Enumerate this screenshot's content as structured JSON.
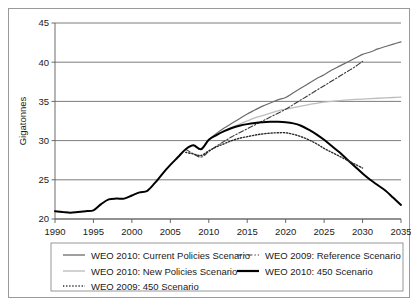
{
  "chart_data": {
    "type": "line",
    "title": "",
    "xlabel": "",
    "ylabel": "Gigatonnes",
    "xlim": [
      1990,
      2035
    ],
    "ylim": [
      20,
      45
    ],
    "ytick_step": 5,
    "xtick_step": 5,
    "grid": true,
    "grid_axis": "y",
    "legend_position": "bottom",
    "xticks": [
      "1990",
      "1995",
      "2000",
      "2005",
      "2010",
      "2015",
      "2020",
      "2025",
      "2030",
      "2035"
    ],
    "yticks": [
      "20",
      "25",
      "30",
      "35",
      "40",
      "45"
    ],
    "series": [
      {
        "name": "WEO 2010: Current Policies Scenario",
        "style": "solid",
        "color": "#6b6b6b",
        "width": 1.2,
        "dash": "",
        "x": [
          2008,
          2009,
          2010,
          2011,
          2012,
          2013,
          2014,
          2015,
          2016,
          2017,
          2018,
          2019,
          2020,
          2021,
          2022,
          2023,
          2024,
          2025,
          2026,
          2027,
          2028,
          2029,
          2030,
          2031,
          2032,
          2033,
          2034,
          2035
        ],
        "values": [
          29.4,
          28.9,
          30.1,
          30.9,
          31.6,
          32.2,
          32.8,
          33.4,
          33.9,
          34.4,
          34.8,
          35.2,
          35.5,
          36.1,
          36.7,
          37.3,
          37.9,
          38.4,
          39.0,
          39.5,
          40.0,
          40.5,
          41.0,
          41.3,
          41.7,
          42.0,
          42.3,
          42.6
        ]
      },
      {
        "name": "WEO 2010: New Policies Scenario",
        "style": "solid",
        "color": "#bdbdbd",
        "width": 1.3,
        "dash": "",
        "x": [
          2008,
          2009,
          2010,
          2011,
          2012,
          2013,
          2014,
          2015,
          2016,
          2017,
          2018,
          2019,
          2020,
          2021,
          2022,
          2023,
          2024,
          2025,
          2026,
          2027,
          2028,
          2029,
          2030,
          2031,
          2032,
          2033,
          2034,
          2035
        ],
        "values": [
          29.4,
          28.9,
          30.1,
          30.7,
          31.2,
          31.7,
          32.1,
          32.5,
          32.9,
          33.2,
          33.5,
          33.8,
          34.0,
          34.2,
          34.4,
          34.6,
          34.75,
          34.9,
          35.0,
          35.1,
          35.2,
          35.25,
          35.3,
          35.35,
          35.4,
          35.45,
          35.5,
          35.55
        ]
      },
      {
        "name": "WEO 2009: Reference Scenario",
        "style": "dashdot",
        "color": "#3a3a3a",
        "width": 1.1,
        "dash": "5,2,1.4,2",
        "x": [
          2007,
          2008,
          2009,
          2010,
          2011,
          2012,
          2013,
          2014,
          2015,
          2016,
          2017,
          2018,
          2019,
          2020,
          2021,
          2022,
          2023,
          2024,
          2025,
          2026,
          2027,
          2028,
          2029,
          2030
        ],
        "values": [
          28.9,
          28.3,
          27.9,
          28.6,
          29.3,
          29.9,
          30.5,
          31.0,
          31.5,
          32.0,
          32.5,
          33.0,
          33.5,
          34.0,
          34.6,
          35.2,
          35.8,
          36.4,
          37.0,
          37.6,
          38.2,
          38.8,
          39.4,
          40.1
        ]
      },
      {
        "name": "WEO 2010: 450 Scenario",
        "style": "solid",
        "color": "#000000",
        "width": 2.0,
        "dash": "",
        "x": [
          1990,
          1991,
          1992,
          1993,
          1994,
          1995,
          1996,
          1997,
          1998,
          1999,
          2000,
          2001,
          2002,
          2003,
          2004,
          2005,
          2006,
          2007,
          2008,
          2009,
          2010,
          2011,
          2012,
          2013,
          2014,
          2015,
          2016,
          2017,
          2018,
          2019,
          2020,
          2021,
          2022,
          2023,
          2024,
          2025,
          2026,
          2027,
          2028,
          2029,
          2030,
          2031,
          2032,
          2033,
          2034,
          2035
        ],
        "values": [
          21.0,
          20.9,
          20.8,
          20.9,
          21.0,
          21.1,
          21.9,
          22.5,
          22.6,
          22.6,
          23.0,
          23.4,
          23.6,
          24.6,
          25.8,
          26.9,
          27.9,
          28.9,
          29.4,
          28.9,
          30.1,
          30.7,
          31.2,
          31.6,
          31.9,
          32.1,
          32.25,
          32.35,
          32.4,
          32.4,
          32.35,
          32.2,
          31.9,
          31.4,
          30.8,
          30.1,
          29.3,
          28.5,
          27.6,
          26.7,
          25.8,
          25.0,
          24.3,
          23.6,
          22.7,
          21.8
        ]
      },
      {
        "name": "WEO 2009: 450 Scenario",
        "style": "dotted",
        "color": "#2a2a2a",
        "width": 1.4,
        "dash": "1.3,1.8",
        "x": [
          2007,
          2008,
          2009,
          2010,
          2011,
          2012,
          2013,
          2014,
          2015,
          2016,
          2017,
          2018,
          2019,
          2020,
          2021,
          2022,
          2023,
          2024,
          2025,
          2026,
          2027,
          2028,
          2029,
          2030
        ],
        "values": [
          28.5,
          28.3,
          28.1,
          28.7,
          29.2,
          29.6,
          30.0,
          30.3,
          30.5,
          30.7,
          30.85,
          30.95,
          31.0,
          31.0,
          30.8,
          30.5,
          30.1,
          29.6,
          29.0,
          28.5,
          28.0,
          27.5,
          27.0,
          26.5
        ]
      }
    ]
  },
  "legend": {
    "entries": [
      {
        "label": "WEO 2010: Current Policies Scenario",
        "color": "#6b6b6b",
        "dash": "",
        "width": 1.3,
        "col": 0,
        "row": 0
      },
      {
        "label": "WEO 2009: Reference Scenario",
        "color": "#3a3a3a",
        "dash": "5,2,1.4,2",
        "width": 1.2,
        "col": 1,
        "row": 0
      },
      {
        "label": "WEO 2010: New Policies Scenario",
        "color": "#bdbdbd",
        "dash": "",
        "width": 1.4,
        "col": 0,
        "row": 1
      },
      {
        "label": "WEO 2010: 450 Scenario",
        "color": "#000000",
        "dash": "",
        "width": 2.2,
        "col": 1,
        "row": 1
      },
      {
        "label": "WEO 2009: 450 Scenario",
        "color": "#2a2a2a",
        "dash": "1.3,1.8",
        "width": 1.5,
        "col": 0,
        "row": 2
      }
    ]
  }
}
